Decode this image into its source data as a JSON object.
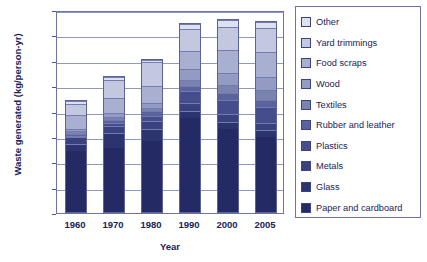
{
  "chart_data": {
    "type": "bar",
    "stacked": true,
    "title": "",
    "xlabel": "Year",
    "ylabel": "Waste generated (kg/person-yr)",
    "categories": [
      "1960",
      "1970",
      "1980",
      "1990",
      "2000",
      "2005"
    ],
    "ylim": [
      0,
      800
    ],
    "yticks": [
      0,
      100,
      200,
      300,
      400,
      500,
      600,
      700,
      800
    ],
    "grid": true,
    "legend_position": "right",
    "series": [
      {
        "name": "Paper and cardboard",
        "color": "#242a63",
        "values": [
          245,
          258,
          283,
          373,
          330,
          300
        ]
      },
      {
        "name": "Glass",
        "color": "#2c3470",
        "values": [
          30,
          60,
          50,
          30,
          27,
          25
        ]
      },
      {
        "name": "Metals",
        "color": "#39417e",
        "values": [
          26,
          28,
          30,
          33,
          33,
          30
        ]
      },
      {
        "name": "Plastics",
        "color": "#454d8c",
        "values": [
          2,
          10,
          22,
          45,
          57,
          63
        ]
      },
      {
        "name": "Rubber and leather",
        "color": "#5b639c",
        "values": [
          9,
          12,
          17,
          22,
          25,
          28
        ]
      },
      {
        "name": "Textiles",
        "color": "#7a82ae",
        "values": [
          12,
          12,
          15,
          22,
          33,
          38
        ]
      },
      {
        "name": "Wood",
        "color": "#949bc2",
        "values": [
          8,
          15,
          20,
          45,
          50,
          55
        ]
      },
      {
        "name": "Food scraps",
        "color": "#a9afd0",
        "values": [
          58,
          62,
          65,
          70,
          90,
          98
        ]
      },
      {
        "name": "Yard trimmings",
        "color": "#c3c8e0",
        "values": [
          45,
          73,
          95,
          88,
          92,
          95
        ]
      },
      {
        "name": "Other",
        "color": "#dde0ee",
        "values": [
          10,
          10,
          10,
          19,
          28,
          23
        ]
      }
    ],
    "totals": [
      445,
      540,
      607,
      747,
      765,
      755
    ]
  }
}
